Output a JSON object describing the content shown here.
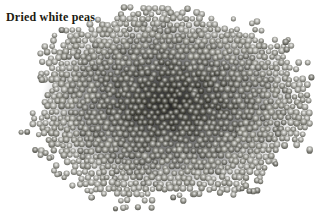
{
  "image": {
    "title_label": "Dried white peas",
    "label_color": "#211b12",
    "background_color": "#ffffff",
    "pile": {
      "center_x": 170,
      "center_y": 104,
      "radius_x": 139,
      "radius_y": 94,
      "grid_step": 6.3,
      "row_ratio": 0.87,
      "jitter": 1.2,
      "pea_radius_min": 2.7,
      "pea_radius_max": 3.5,
      "edge_noise": 0.05,
      "edge_fade_start": 0.97,
      "edge_keep_prob": 0.5,
      "scatter_count": 58,
      "scatter_min_dist": 1.02,
      "scatter_max_dist": 1.13,
      "seed": 9,
      "backdrop_color_center": "rgba(8,8,8,0.88)",
      "backdrop_color_mid": "rgba(18,18,18,0.45)",
      "backdrop_color_edge": "rgba(30,30,30,0)",
      "shades": [
        {
          "hi": "#f2f2f0",
          "mid": "#a9a9a3",
          "dark": "#56564f"
        },
        {
          "hi": "#e8e8e6",
          "mid": "#97978f",
          "dark": "#4a4a43"
        },
        {
          "hi": "#dcdcda",
          "mid": "#84847d",
          "dark": "#3e3e38"
        },
        {
          "hi": "#cfcfcd",
          "mid": "#72726b",
          "dark": "#33332e"
        },
        {
          "hi": "#c2c2c0",
          "mid": "#616159",
          "dark": "#292924"
        },
        {
          "hi": "#b4b4b2",
          "mid": "#525249",
          "dark": "#201f1b"
        }
      ]
    }
  }
}
